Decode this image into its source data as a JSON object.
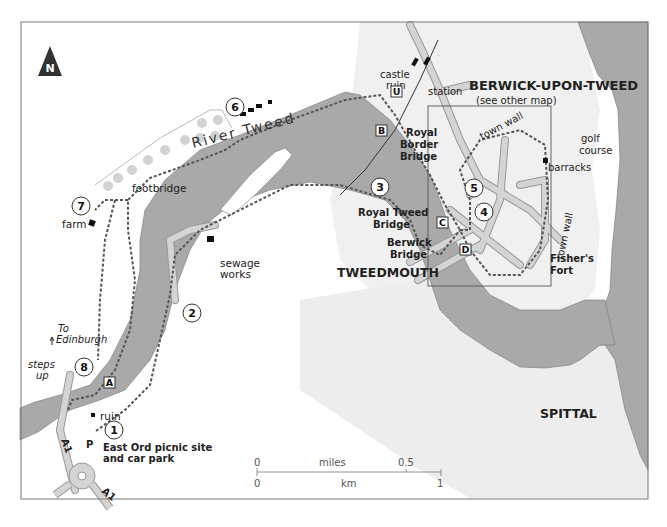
{
  "map": {
    "north_label": "N",
    "river_label": "River Tweed",
    "towns": {
      "berwick": "BERWICK-UPON-TWEED",
      "berwick_note": "(see other map)",
      "tweedmouth": "TWEEDMOUTH",
      "spittal": "SPITTAL"
    },
    "places": {
      "castle_ruin_1": "castle",
      "castle_ruin_2": "ruin",
      "station": "station",
      "golf_1": "golf",
      "golf_2": "course",
      "barracks": "barracks",
      "town_wall_top": "town wall",
      "town_wall_right": "town wall",
      "fishers_fort_1": "Fisher's",
      "fishers_fort_2": "Fort",
      "royal_border_1": "Royal",
      "royal_border_2": "Border",
      "royal_border_3": "Bridge",
      "royal_tweed_1": "Royal Tweed",
      "royal_tweed_2": "Bridge",
      "berwick_bridge_1": "Berwick",
      "berwick_bridge_2": "Bridge",
      "footbridge": "footbridge",
      "farm": "farm",
      "sewage_1": "sewage",
      "sewage_2": "works",
      "to_edinburgh_1": "To",
      "to_edinburgh_2": "Edinburgh",
      "steps_1": "steps",
      "steps_2": "up",
      "ruin": "ruin",
      "east_ord_1": "East Ord picnic site",
      "east_ord_2": "and car park",
      "road_a1_north": "A1",
      "road_a1_south": "A1",
      "parking": "P"
    },
    "waypoints": [
      "1",
      "2",
      "3",
      "4",
      "5",
      "6",
      "7",
      "8"
    ],
    "markers": [
      "A",
      "B",
      "C",
      "D",
      "U"
    ],
    "scale": {
      "miles_label": "miles",
      "km_label": "km",
      "miles_zero": "0",
      "miles_half": "0.5",
      "km_zero": "0",
      "km_one": "1"
    },
    "colors": {
      "water": "#a9a9a9",
      "land_shade": "#ececec",
      "road": "#c8c8c8",
      "route": "#555555",
      "frame": "#777777"
    }
  }
}
